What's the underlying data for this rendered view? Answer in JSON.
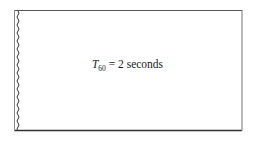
{
  "diagram": {
    "type": "room-reverberation-box",
    "label": {
      "symbol": "T",
      "subscript": "60",
      "equals": " = ",
      "value": "2",
      "unit": "seconds"
    },
    "box": {
      "left": 14,
      "top": 10,
      "right": 242,
      "bottom": 130,
      "stroke_color": "#555555"
    },
    "wavy_edge": {
      "side": "left",
      "color": "#333333"
    }
  }
}
